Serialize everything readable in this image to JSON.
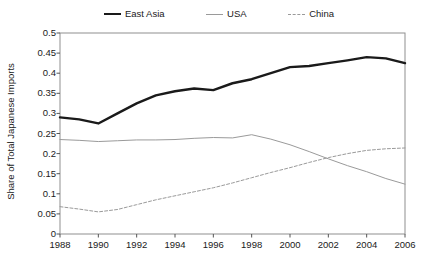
{
  "chart_data": {
    "type": "line",
    "title": "",
    "xlabel": "",
    "ylabel": "Share of Total Japanese Imports",
    "xlim": [
      1988,
      2006
    ],
    "ylim": [
      0,
      0.5
    ],
    "grid": false,
    "legend_position": "top-center",
    "x": [
      1988,
      1989,
      1990,
      1991,
      1992,
      1993,
      1994,
      1995,
      1996,
      1997,
      1998,
      1999,
      2000,
      2001,
      2002,
      2003,
      2004,
      2005,
      2006
    ],
    "xticks": [
      "1988",
      "1990",
      "1992",
      "1994",
      "1996",
      "1998",
      "2000",
      "2002",
      "2004",
      "2006"
    ],
    "xtick_values": [
      1988,
      1990,
      1992,
      1994,
      1996,
      1998,
      2000,
      2002,
      2004,
      2006
    ],
    "yticks": [
      "0",
      "0.05",
      "0.1",
      "0.15",
      "0.2",
      "0.25",
      "0.3",
      "0.35",
      "0.4",
      "0.45",
      "0.5"
    ],
    "ytick_values": [
      0,
      0.05,
      0.1,
      0.15,
      0.2,
      0.25,
      0.3,
      0.35,
      0.4,
      0.45,
      0.5
    ],
    "series": [
      {
        "name": "East Asia",
        "color": "#1a1a1a",
        "width": 2.4,
        "dash": "none",
        "values": [
          0.29,
          0.285,
          0.275,
          0.3,
          0.325,
          0.345,
          0.355,
          0.362,
          0.358,
          0.375,
          0.385,
          0.4,
          0.415,
          0.418,
          0.425,
          0.432,
          0.44,
          0.437,
          0.425
        ]
      },
      {
        "name": "USA",
        "color": "#9a9a9a",
        "width": 1.0,
        "dash": "none",
        "values": [
          0.235,
          0.233,
          0.23,
          0.232,
          0.234,
          0.234,
          0.235,
          0.238,
          0.24,
          0.239,
          0.247,
          0.236,
          0.222,
          0.205,
          0.187,
          0.17,
          0.155,
          0.138,
          0.124
        ]
      },
      {
        "name": "China",
        "color": "#9a9a9a",
        "width": 1.0,
        "dash": "3,2",
        "values": [
          0.068,
          0.062,
          0.055,
          0.061,
          0.073,
          0.085,
          0.095,
          0.105,
          0.115,
          0.127,
          0.14,
          0.153,
          0.165,
          0.178,
          0.19,
          0.2,
          0.208,
          0.212,
          0.214
        ]
      }
    ]
  },
  "legend": {
    "entries": [
      {
        "label": "East Asia"
      },
      {
        "label": "USA"
      },
      {
        "label": "China"
      }
    ]
  }
}
